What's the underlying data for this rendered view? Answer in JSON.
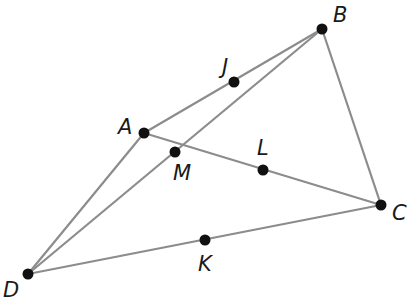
{
  "diagram": {
    "type": "geometry-figure",
    "points": {
      "A": {
        "label": "A",
        "x": 144,
        "y": 133,
        "lx": 118,
        "ly": 134
      },
      "B": {
        "label": "B",
        "x": 322,
        "y": 29,
        "lx": 333,
        "ly": 22
      },
      "C": {
        "label": "C",
        "x": 381,
        "y": 205,
        "lx": 392,
        "ly": 220
      },
      "D": {
        "label": "D",
        "x": 28,
        "y": 274,
        "lx": 3,
        "ly": 297
      },
      "J": {
        "label": "J",
        "x": 234,
        "y": 82,
        "lx": 222,
        "ly": 74
      },
      "M": {
        "label": "M",
        "x": 175,
        "y": 152,
        "lx": 173,
        "ly": 180
      },
      "L": {
        "label": "L",
        "x": 263,
        "y": 170,
        "lx": 257,
        "ly": 155
      },
      "K": {
        "label": "K",
        "x": 205,
        "y": 240,
        "lx": 198,
        "ly": 271
      }
    },
    "segments": [
      [
        "A",
        "B"
      ],
      [
        "B",
        "C"
      ],
      [
        "C",
        "D"
      ],
      [
        "D",
        "A"
      ],
      [
        "A",
        "C"
      ],
      [
        "D",
        "B"
      ]
    ],
    "colors": {
      "line": "#8c8c8c",
      "point": "#111111",
      "label": "#1a1a1a"
    }
  }
}
